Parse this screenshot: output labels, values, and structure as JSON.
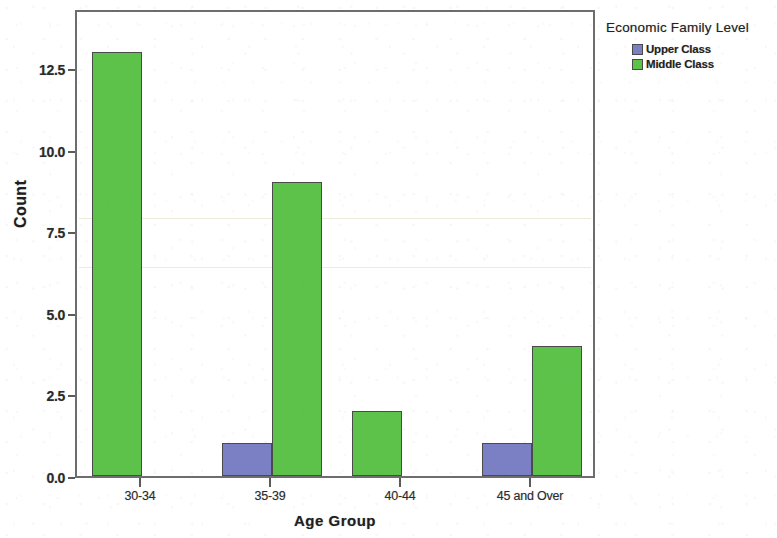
{
  "chart_data": {
    "type": "bar",
    "title": "",
    "xlabel": "Age Group",
    "ylabel": "Count",
    "categories": [
      "30-34",
      "35-39",
      "40-44",
      "45 and Over"
    ],
    "series": [
      {
        "name": "Upper Class",
        "color": "#7b7fc4",
        "values": [
          0,
          1,
          0,
          1
        ]
      },
      {
        "name": "Middle Class",
        "color": "#5cc24a",
        "values": [
          13,
          9,
          2,
          4
        ]
      }
    ],
    "ylim": [
      0,
      14.35
    ],
    "yticks": [
      "0.0",
      "2.5",
      "5.0",
      "7.5",
      "10.0",
      "12.5"
    ],
    "ytick_values": [
      0,
      2.5,
      5,
      7.5,
      10,
      12.5
    ],
    "grid": false,
    "legend": {
      "title": "Economic Family Level",
      "position": "right",
      "entries": [
        {
          "label": "Upper Class",
          "color": "#7b7fc4"
        },
        {
          "label": "Middle Class",
          "color": "#5cc24a"
        }
      ]
    }
  },
  "axes": {
    "y_title": "Count",
    "x_title": "Age Group"
  },
  "colors": {
    "upper_class": "#7b7fc4",
    "middle_class": "#5cc24a",
    "frame": "#6d6d6d",
    "text": "#232323"
  }
}
